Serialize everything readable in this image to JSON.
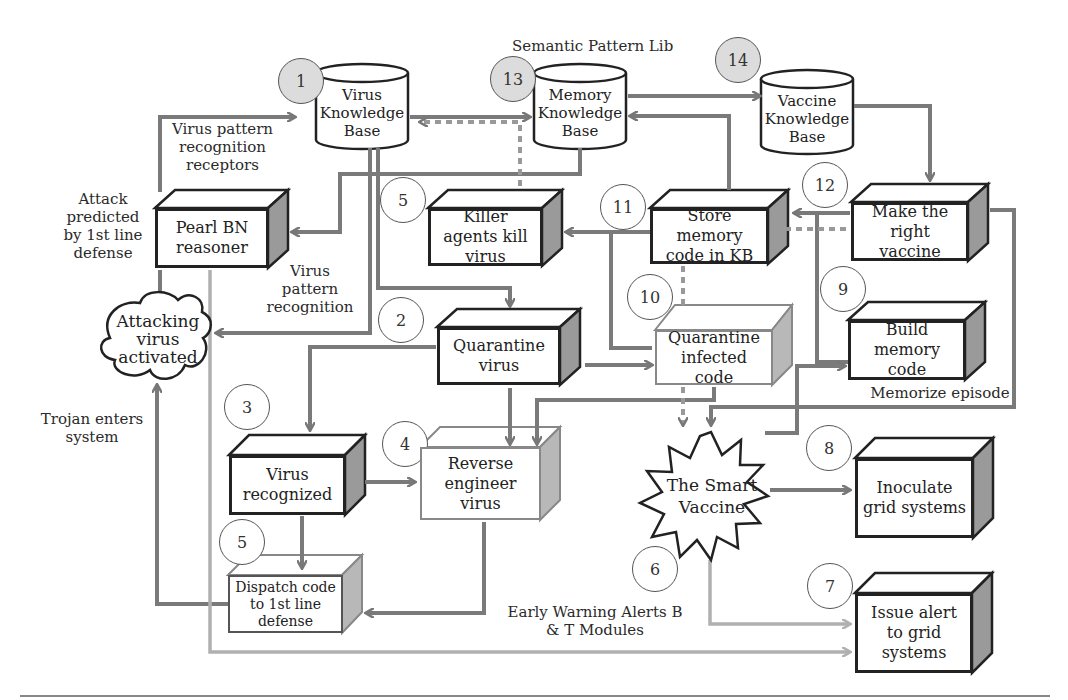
{
  "diagram": {
    "header_label": "Semantic Pattern Lib",
    "databases": [
      {
        "id": "virus_kb",
        "step": "1",
        "label": "Virus Knowledge Base"
      },
      {
        "id": "memory_kb",
        "step": "13",
        "label": "Memory Knowledge Base"
      },
      {
        "id": "vaccine_kb",
        "step": "14",
        "label": "Vaccine Knowledge Base"
      }
    ],
    "nodes": {
      "pearl_bn": {
        "label": "Pearl BN reasoner"
      },
      "killer_agents": {
        "step": "5",
        "label": "Killer agents kill virus"
      },
      "store_memory": {
        "step": "11",
        "label": "Store memory code in KB"
      },
      "make_vaccine": {
        "step": "12",
        "label": "Make the right vaccine"
      },
      "quarantine_virus": {
        "step": "2",
        "label": "Quarantine virus"
      },
      "quarantine_code": {
        "step": "10",
        "label": "Quarantine infected code"
      },
      "build_memory": {
        "step": "9",
        "label": "Build memory code"
      },
      "virus_recognized": {
        "step": "3",
        "label": "Virus recognized"
      },
      "reverse_engineer": {
        "step": "4",
        "label": "Reverse engineer virus"
      },
      "dispatch_code": {
        "step": "5",
        "label": "Dispatch code to 1st line defense"
      },
      "smart_vaccine": {
        "step": "6",
        "label": "The Smart Vaccine"
      },
      "inoculate": {
        "step": "8",
        "label": "Inoculate grid systems"
      },
      "issue_alert": {
        "step": "7",
        "label": "Issue alert to grid systems"
      },
      "attacking_virus": {
        "label": "Attacking virus activated"
      }
    },
    "annotations": {
      "receptors": "Virus pattern recognition receptors",
      "attack_predicted": "Attack predicted by 1st line defense",
      "pattern_recognition": "Virus pattern recognition",
      "trojan": "Trojan enters system",
      "memorize": "Memorize episode",
      "early_warning": "Early Warning Alerts B & T Modules"
    },
    "colors": {
      "dark_border": "#222222",
      "arrow_gray": "#7a7a7a",
      "light_arrow": "#b0b0b0",
      "shaded_circle": "#dcdcdc",
      "side_face": "#9a9a9a"
    }
  }
}
